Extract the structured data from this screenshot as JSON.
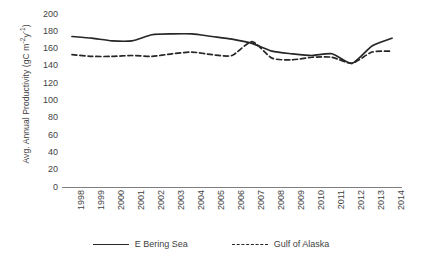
{
  "chart_data": {
    "type": "line",
    "title": "",
    "xlabel": "",
    "ylabel": "Avg. Annual Productivity (gC m⁻²y⁻¹)",
    "ylabel_parts": {
      "prefix": "Avg. Annual Productivity (gC m",
      "sup1": "-2",
      "mid": "y",
      "sup2": "-1",
      "suffix": ")"
    },
    "categories": [
      "1998",
      "1999",
      "2000",
      "2001",
      "2002",
      "2003",
      "2004",
      "2005",
      "2006",
      "2007",
      "2008",
      "2009",
      "2010",
      "2011",
      "2012",
      "2013",
      "2014"
    ],
    "x": [
      1998,
      1999,
      2000,
      2001,
      2002,
      2003,
      2004,
      2005,
      2006,
      2007,
      2008,
      2009,
      2010,
      2011,
      2012,
      2013,
      2014
    ],
    "ylim": [
      0,
      200
    ],
    "yticks": [
      200,
      180,
      160,
      140,
      120,
      100,
      80,
      60,
      40,
      20,
      0
    ],
    "grid": false,
    "legend_position": "bottom",
    "series": [
      {
        "name": "E Bering Sea",
        "style": "solid",
        "color": "#262626",
        "values": [
          174,
          172,
          169,
          169,
          176,
          177,
          177,
          174,
          171,
          166,
          157,
          154,
          152,
          154,
          143,
          163,
          172
        ]
      },
      {
        "name": "Gulf of Alaska",
        "style": "dashed",
        "color": "#262626",
        "values": [
          153,
          151,
          151,
          152,
          151,
          154,
          156,
          153,
          152,
          168,
          149,
          147,
          150,
          150,
          143,
          156,
          157
        ]
      }
    ]
  },
  "legend": {
    "items": [
      {
        "label": "E Bering Sea",
        "style": "solid"
      },
      {
        "label": "Gulf of Alaska",
        "style": "dashed"
      }
    ]
  },
  "colors": {
    "line": "#262626",
    "axis": "#7f7f7f",
    "text": "#3f3f3f",
    "background": "#ffffff"
  }
}
